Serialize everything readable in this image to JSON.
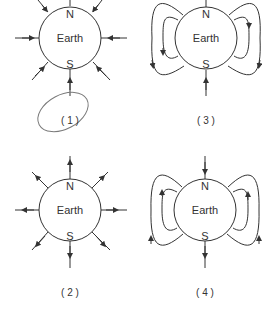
{
  "diagrams": [
    {
      "id": "1",
      "label": "( 1 )",
      "planet": "Earth",
      "north": "N",
      "south": "S",
      "field": "radial-inward",
      "annotated": true
    },
    {
      "id": "2",
      "label": "( 2 )",
      "planet": "Earth",
      "north": "N",
      "south": "S",
      "field": "radial-outward",
      "annotated": false
    },
    {
      "id": "3",
      "label": "( 3 )",
      "planet": "Earth",
      "north": "N",
      "south": "S",
      "field": "dipole-loops-enter-south",
      "annotated": false
    },
    {
      "id": "4",
      "label": "( 4 )",
      "planet": "Earth",
      "north": "N",
      "south": "S",
      "field": "dipole-loops-enter-north",
      "annotated": false
    }
  ],
  "colors": {
    "line": "#333333",
    "annotation": "#7a7a7a",
    "background": "#ffffff"
  }
}
